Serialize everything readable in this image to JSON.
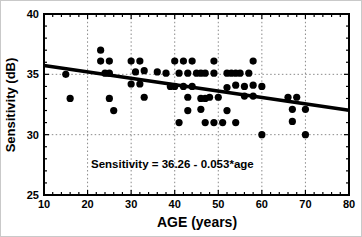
{
  "chart_data": {
    "type": "scatter",
    "title": "",
    "xlabel": "AGE (years)",
    "ylabel": "Sensitivity (dB)",
    "xlim": [
      10,
      80
    ],
    "ylim": [
      25,
      40
    ],
    "x_ticks": [
      10,
      20,
      30,
      40,
      50,
      60,
      70,
      80
    ],
    "y_ticks": [
      25,
      30,
      35,
      40
    ],
    "x_minor_step": 2,
    "y_minor_step": 1,
    "grid": {
      "x": [
        20,
        30,
        40,
        50,
        60,
        70
      ],
      "y": [
        30,
        35
      ],
      "style": "dotted"
    },
    "annotation": "Sensitivity = 36.26 - 0.053*age",
    "regression": {
      "intercept": 36.26,
      "slope": -0.053
    },
    "legend": "none",
    "colors": {
      "marker": "#000000",
      "regression_line": "#000000",
      "grid": "#8a8a8a",
      "frame": "#000000",
      "background": "#ffffff"
    },
    "series": [
      {
        "name": "sensitivity-vs-age-points",
        "marker": "filled-circle",
        "marker_radius_px": 3.6,
        "points": [
          [
            23,
            37
          ],
          [
            23,
            36.1
          ],
          [
            25,
            36.1
          ],
          [
            30,
            36.1
          ],
          [
            32,
            36.1
          ],
          [
            40,
            36.1
          ],
          [
            42,
            36.1
          ],
          [
            44,
            36.1
          ],
          [
            49,
            36.1
          ],
          [
            58,
            36.1
          ],
          [
            15,
            35
          ],
          [
            24,
            35.1
          ],
          [
            25,
            35.1
          ],
          [
            31,
            35.2
          ],
          [
            33,
            35.3
          ],
          [
            36,
            35.2
          ],
          [
            38,
            35.1
          ],
          [
            41,
            35.1
          ],
          [
            43,
            35.1
          ],
          [
            45,
            35.1
          ],
          [
            46,
            35.1
          ],
          [
            47,
            35.1
          ],
          [
            49,
            35.1
          ],
          [
            52,
            35.1
          ],
          [
            53,
            35.1
          ],
          [
            54,
            35.1
          ],
          [
            55,
            35.1
          ],
          [
            57,
            35.1
          ],
          [
            30,
            34.2
          ],
          [
            32,
            34.2
          ],
          [
            39,
            34
          ],
          [
            40,
            34
          ],
          [
            42,
            34
          ],
          [
            44,
            34
          ],
          [
            52,
            33.9
          ],
          [
            54,
            34.1
          ],
          [
            56,
            34
          ],
          [
            58,
            34.1
          ],
          [
            60,
            34
          ],
          [
            16,
            33
          ],
          [
            25,
            33
          ],
          [
            33,
            33.1
          ],
          [
            43,
            33.1
          ],
          [
            46,
            33
          ],
          [
            47,
            33
          ],
          [
            48,
            33.1
          ],
          [
            50,
            33.1
          ],
          [
            56,
            33.2
          ],
          [
            58,
            33.2
          ],
          [
            66,
            33.1
          ],
          [
            68,
            33.1
          ],
          [
            26,
            32
          ],
          [
            43,
            32
          ],
          [
            46,
            32.1
          ],
          [
            52,
            32
          ],
          [
            67,
            32.1
          ],
          [
            70,
            32.1
          ],
          [
            41,
            31
          ],
          [
            47,
            31
          ],
          [
            49,
            31
          ],
          [
            51,
            31
          ],
          [
            54,
            31
          ],
          [
            67,
            31.1
          ],
          [
            60,
            30
          ],
          [
            70,
            30
          ]
        ]
      }
    ]
  }
}
